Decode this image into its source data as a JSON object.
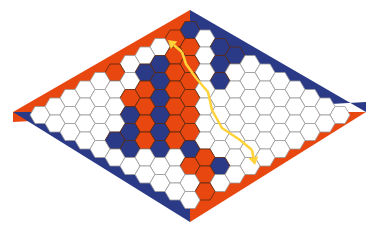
{
  "game": {
    "title": "Hex board 11x11 with winning path",
    "size": 11,
    "colors": {
      "red": "#e8470f",
      "blue": "#2a3a86",
      "white": "#ffffff",
      "grid_line": "#9a9a9a",
      "dark_line": "#5a2a10",
      "arrow": "#ffd23a"
    },
    "edges": {
      "top_left": "red",
      "bottom_right": "red",
      "top_right": "blue",
      "bottom_left": "blue"
    },
    "cells": [
      "BWBBWWWWWWW",
      "RRWBWWWWWWW",
      "WRRWBWWWWWW",
      "WBRRWWWWWWW",
      "WBBRRWWWWWW",
      "RWRBRRWWWWW",
      "WWRRBRRWWWW",
      "WWWBRBRBRBW",
      "WWWWBRBWRRW",
      "WWWWBBWWWWR",
      "WWWWWWWWWWW"
    ],
    "cell_legend": {
      "R": "red",
      "B": "blue",
      "W": "empty"
    },
    "path": {
      "label": "winning red chain",
      "points": [
        [
          255,
          165
        ],
        [
          252,
          150
        ],
        [
          240,
          140
        ],
        [
          222,
          128
        ],
        [
          212,
          110
        ],
        [
          208,
          92
        ],
        [
          196,
          78
        ],
        [
          186,
          64
        ],
        [
          182,
          52
        ],
        [
          168,
          40
        ]
      ]
    }
  }
}
